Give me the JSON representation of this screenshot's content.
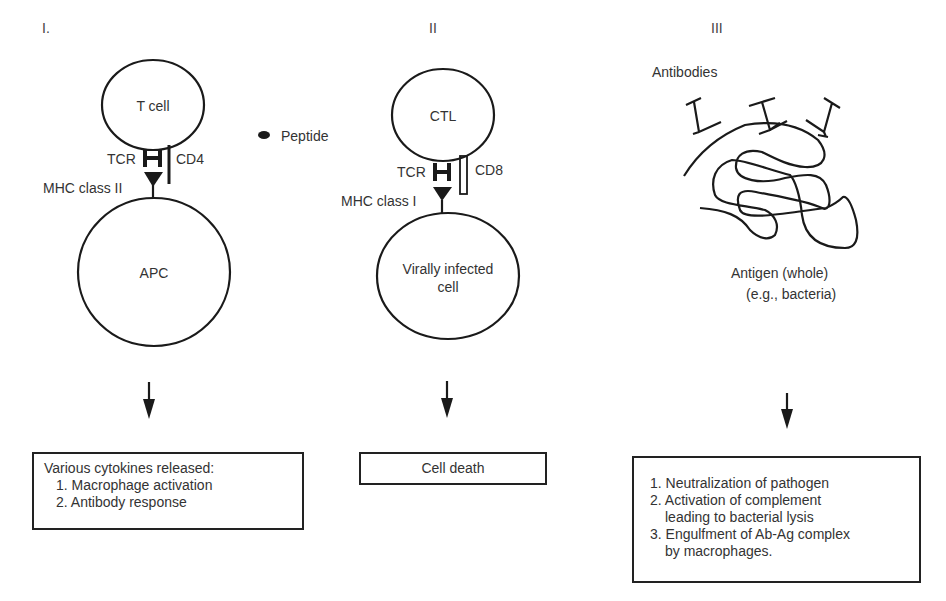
{
  "panels": [
    {
      "numeral": "I.",
      "upper_cell": "T cell",
      "receptor": "TCR",
      "coreceptor": "CD4",
      "mhc": "MHC class II",
      "lower_cell": "APC",
      "outcome": {
        "title": "Various cytokines released:",
        "items": [
          "1. Macrophage activation",
          "2. Antibody response"
        ]
      }
    },
    {
      "numeral": "II",
      "upper_cell": "CTL",
      "receptor": "TCR",
      "coreceptor": "CD8",
      "mhc": "MHC class I",
      "lower_cell_lines": [
        "Virally infected",
        "cell"
      ],
      "outcome": {
        "title": "Cell  death"
      }
    },
    {
      "numeral": "III",
      "antibodies_label": "Antibodies",
      "antigen_label_lines": [
        "Antigen (whole)",
        "(e.g., bacteria)"
      ],
      "outcome": {
        "items": [
          "1. Neutralization of pathogen",
          "2. Activation of complement",
          "    leading to bacterial lysis",
          "3. Engulfment of Ab-Ag complex",
          "    by macrophages."
        ]
      }
    }
  ],
  "peptide_label": "Peptide",
  "colors": {
    "stroke": "#1a1a1a",
    "text": "#333333",
    "background": "#ffffff"
  }
}
